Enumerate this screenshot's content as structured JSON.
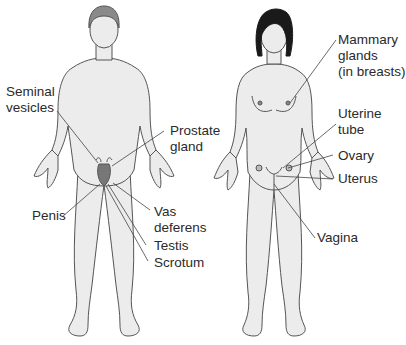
{
  "diagram": {
    "male": {
      "labels": {
        "seminal_vesicles_1": "Seminal",
        "seminal_vesicles_2": "vesicles",
        "prostate_1": "Prostate",
        "prostate_2": "gland",
        "penis": "Penis",
        "vas_deferens_1": "Vas",
        "vas_deferens_2": "deferens",
        "testis": "Testis",
        "scrotum": "Scrotum"
      }
    },
    "female": {
      "labels": {
        "mammary_1": "Mammary",
        "mammary_2": "glands",
        "mammary_3": "(in breasts)",
        "uterine_tube_1": "Uterine",
        "uterine_tube_2": "tube",
        "ovary": "Ovary",
        "uterus": "Uterus",
        "vagina": "Vagina"
      }
    },
    "colors": {
      "skin": "#ececec",
      "outline": "#555555",
      "male_hair": "#8a8a8a",
      "female_hair": "#1a1a1a",
      "leader": "#444444",
      "text": "#2a2a2a"
    }
  }
}
